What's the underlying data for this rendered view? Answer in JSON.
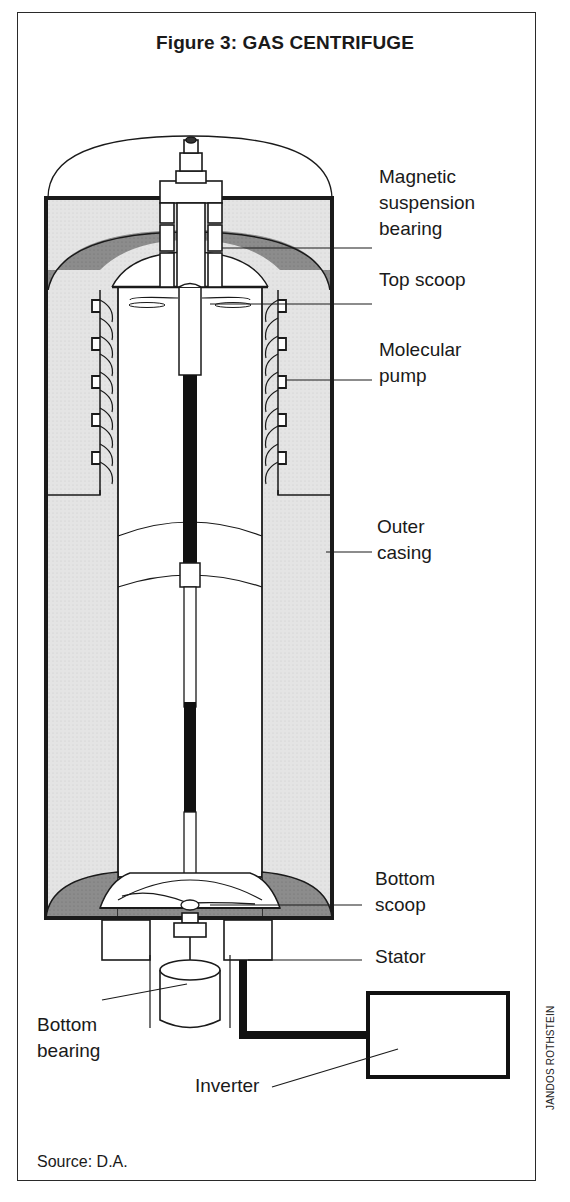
{
  "figure": {
    "title": "Figure 3: GAS CENTRIFUGE",
    "source": "Source: D.A.",
    "credit": "JANDOS ROTHSTEIN"
  },
  "labels": {
    "magnetic_bearing": "Magnetic\nsuspension\nbearing",
    "top_scoop": "Top scoop",
    "molecular_pump": "Molecular\npump",
    "outer_casing": "Outer\ncasing",
    "bottom_scoop": "Bottom\nscoop",
    "stator": "Stator",
    "bottom_bearing": "Bottom\nbearing",
    "inverter": "Inverter"
  },
  "colors": {
    "ink": "#1a1a1a",
    "light_fill": "#e4e4e4",
    "dark_fill": "#8c8c8c"
  }
}
